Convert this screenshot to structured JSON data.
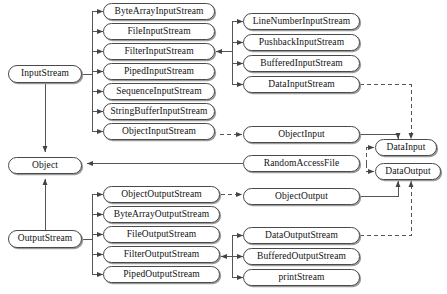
{
  "diagram": {
    "caption": "",
    "colors": {
      "background": "#ffffff",
      "node_border": "#4a4a4a",
      "node_fill": "#ffffff",
      "node_shadow": "#9a9a9a",
      "edge": "#555555",
      "text": "#111111"
    },
    "nodes": [
      {
        "id": "InputStream",
        "label": "InputStream",
        "x": 8,
        "y": 65,
        "w": 74,
        "h": 18
      },
      {
        "id": "ByteArrayInputStream",
        "label": "ByteArrayInputStream",
        "x": 103,
        "y": 3,
        "w": 112,
        "h": 17
      },
      {
        "id": "FileInputStream",
        "label": "FileInputStream",
        "x": 103,
        "y": 23,
        "w": 112,
        "h": 17
      },
      {
        "id": "FilterInputStream",
        "label": "FilterInputStream",
        "x": 103,
        "y": 43,
        "w": 112,
        "h": 17
      },
      {
        "id": "PipedInputStream",
        "label": "PipedInputStream",
        "x": 103,
        "y": 63,
        "w": 112,
        "h": 17
      },
      {
        "id": "SequenceInputStream",
        "label": "SequenceInputStream",
        "x": 103,
        "y": 83,
        "w": 112,
        "h": 17
      },
      {
        "id": "StringBufferInputStream",
        "label": "StringBufferInputStream",
        "x": 103,
        "y": 103,
        "w": 112,
        "h": 17
      },
      {
        "id": "ObjectInputStream",
        "label": "ObjectInputStream",
        "x": 103,
        "y": 123,
        "w": 112,
        "h": 17
      },
      {
        "id": "LineNumberInputStream",
        "label": "LineNumberInputStream",
        "x": 243,
        "y": 13,
        "w": 117,
        "h": 17
      },
      {
        "id": "PushbackInputStream",
        "label": "PushbackInputStream",
        "x": 243,
        "y": 34,
        "w": 117,
        "h": 17
      },
      {
        "id": "BufferedInputStream",
        "label": "BufferedInputStream",
        "x": 243,
        "y": 55,
        "w": 117,
        "h": 17
      },
      {
        "id": "DataInputStream",
        "label": "DataInputStream",
        "x": 243,
        "y": 76,
        "w": 117,
        "h": 17
      },
      {
        "id": "ObjectInput",
        "label": "ObjectInput",
        "x": 243,
        "y": 126,
        "w": 117,
        "h": 17
      },
      {
        "id": "DataInput",
        "label": "DataInput",
        "x": 375,
        "y": 139,
        "w": 62,
        "h": 17
      },
      {
        "id": "Object",
        "label": "Object",
        "x": 8,
        "y": 157,
        "w": 74,
        "h": 17
      },
      {
        "id": "RandomAccessFile",
        "label": "RandomAccessFile",
        "x": 243,
        "y": 155,
        "w": 117,
        "h": 17
      },
      {
        "id": "DataOutput",
        "label": "DataOutput",
        "x": 375,
        "y": 163,
        "w": 66,
        "h": 17
      },
      {
        "id": "ObjectOutput",
        "label": "ObjectOutput",
        "x": 243,
        "y": 188,
        "w": 117,
        "h": 17
      },
      {
        "id": "ObjectOutputStream",
        "label": "ObjectOutputStream",
        "x": 103,
        "y": 186,
        "w": 117,
        "h": 17
      },
      {
        "id": "ByteArrayOutputStream",
        "label": "ByteArrayOutputStream",
        "x": 103,
        "y": 206,
        "w": 117,
        "h": 17
      },
      {
        "id": "FileOutputStream",
        "label": "FileOutputStream",
        "x": 103,
        "y": 226,
        "w": 117,
        "h": 17
      },
      {
        "id": "FilterOutputStream",
        "label": "FilterOutputStream",
        "x": 103,
        "y": 246,
        "w": 117,
        "h": 17
      },
      {
        "id": "PipedOutputStream",
        "label": "PipedOutputStream",
        "x": 103,
        "y": 266,
        "w": 117,
        "h": 17
      },
      {
        "id": "OutputStream",
        "label": "OutputStream",
        "x": 8,
        "y": 230,
        "w": 74,
        "h": 18
      },
      {
        "id": "DataOutputStream",
        "label": "DataOutputStream",
        "x": 243,
        "y": 227,
        "w": 117,
        "h": 17
      },
      {
        "id": "BufferedOutputStream",
        "label": "BufferedOutputStream",
        "x": 243,
        "y": 248,
        "w": 117,
        "h": 17
      },
      {
        "id": "printStream",
        "label": "printStream",
        "x": 243,
        "y": 269,
        "w": 117,
        "h": 17
      }
    ],
    "edges": [
      {
        "from": "InputStream",
        "to": "ByteArrayInputStream",
        "style": "solid",
        "kind": "inheritance"
      },
      {
        "from": "InputStream",
        "to": "FileInputStream",
        "style": "solid",
        "kind": "inheritance"
      },
      {
        "from": "InputStream",
        "to": "FilterInputStream",
        "style": "solid",
        "kind": "inheritance"
      },
      {
        "from": "InputStream",
        "to": "PipedInputStream",
        "style": "solid",
        "kind": "inheritance"
      },
      {
        "from": "InputStream",
        "to": "SequenceInputStream",
        "style": "solid",
        "kind": "inheritance"
      },
      {
        "from": "InputStream",
        "to": "StringBufferInputStream",
        "style": "solid",
        "kind": "inheritance"
      },
      {
        "from": "InputStream",
        "to": "ObjectInputStream",
        "style": "solid",
        "kind": "inheritance"
      },
      {
        "from": "FilterInputStream",
        "to": "LineNumberInputStream",
        "style": "solid",
        "kind": "inheritance"
      },
      {
        "from": "FilterInputStream",
        "to": "PushbackInputStream",
        "style": "solid",
        "kind": "inheritance"
      },
      {
        "from": "FilterInputStream",
        "to": "BufferedInputStream",
        "style": "solid",
        "kind": "inheritance"
      },
      {
        "from": "FilterInputStream",
        "to": "DataInputStream",
        "style": "solid",
        "kind": "inheritance"
      },
      {
        "from": "ObjectInputStream",
        "to": "ObjectInput",
        "style": "dashed",
        "kind": "realization"
      },
      {
        "from": "ObjectInput",
        "to": "DataInput",
        "style": "solid",
        "kind": "inheritance"
      },
      {
        "from": "DataInputStream",
        "to": "DataInput",
        "style": "dashed",
        "kind": "realization"
      },
      {
        "from": "RandomAccessFile",
        "to": "DataInput",
        "style": "dashed",
        "kind": "realization"
      },
      {
        "from": "RandomAccessFile",
        "to": "DataOutput",
        "style": "dashed",
        "kind": "realization"
      },
      {
        "from": "RandomAccessFile",
        "to": "Object",
        "style": "solid",
        "kind": "inheritance"
      },
      {
        "from": "InputStream",
        "to": "Object",
        "style": "solid",
        "kind": "inheritance"
      },
      {
        "from": "OutputStream",
        "to": "Object",
        "style": "solid",
        "kind": "inheritance"
      },
      {
        "from": "ObjectOutput",
        "to": "DataOutput",
        "style": "solid",
        "kind": "inheritance"
      },
      {
        "from": "DataOutputStream",
        "to": "DataOutput",
        "style": "dashed",
        "kind": "realization"
      },
      {
        "from": "ObjectOutputStream",
        "to": "ObjectOutput",
        "style": "dashed",
        "kind": "realization"
      },
      {
        "from": "OutputStream",
        "to": "ObjectOutputStream",
        "style": "solid",
        "kind": "inheritance"
      },
      {
        "from": "OutputStream",
        "to": "ByteArrayOutputStream",
        "style": "solid",
        "kind": "inheritance"
      },
      {
        "from": "OutputStream",
        "to": "FileOutputStream",
        "style": "solid",
        "kind": "inheritance"
      },
      {
        "from": "OutputStream",
        "to": "FilterOutputStream",
        "style": "solid",
        "kind": "inheritance"
      },
      {
        "from": "OutputStream",
        "to": "PipedOutputStream",
        "style": "solid",
        "kind": "inheritance"
      },
      {
        "from": "FilterOutputStream",
        "to": "DataOutputStream",
        "style": "solid",
        "kind": "inheritance"
      },
      {
        "from": "FilterOutputStream",
        "to": "BufferedOutputStream",
        "style": "solid",
        "kind": "inheritance"
      },
      {
        "from": "FilterOutputStream",
        "to": "printStream",
        "style": "solid",
        "kind": "inheritance"
      }
    ]
  }
}
